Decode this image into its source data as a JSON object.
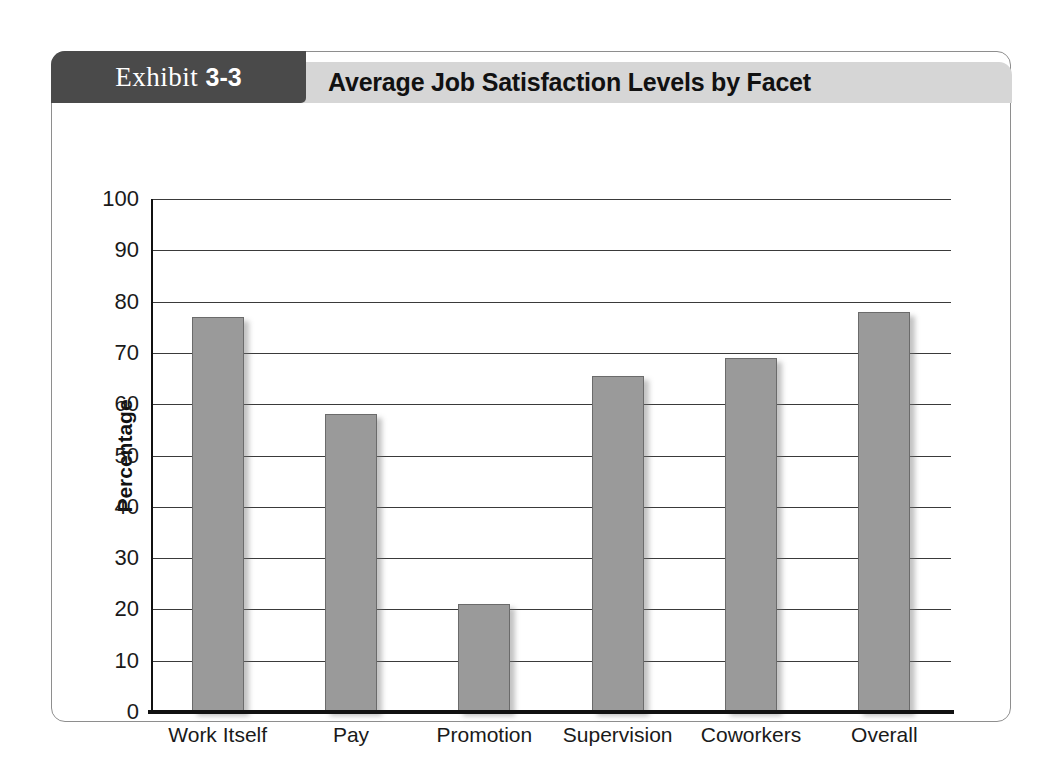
{
  "exhibit": {
    "tab_word": "Exhibit",
    "tab_number": "3-3",
    "title": "Average Job Satisfaction Levels by Facet"
  },
  "chart_data": {
    "type": "bar",
    "title": "Average Job Satisfaction Levels by Facet",
    "xlabel": "",
    "ylabel": "Percentage",
    "ylim": [
      0,
      100
    ],
    "ytick_step": 10,
    "yticks": [
      "100",
      "90",
      "80",
      "70",
      "60",
      "50",
      "40",
      "30",
      "20",
      "10",
      "0"
    ],
    "grid": true,
    "legend": "none",
    "bar_color": "#9a9a9a",
    "bar_edge_color": "#6b6b6b",
    "categories": [
      "Work Itself",
      "Pay",
      "Promotion",
      "Supervision",
      "Coworkers",
      "Overall"
    ],
    "values": [
      77,
      58,
      21,
      65.5,
      69,
      78
    ]
  },
  "colors": {
    "tab_background": "#4a4a4a",
    "title_band": "#d6d6d6",
    "card_border": "#8e8e8e",
    "axis": "#111111",
    "page_background": "#ffffff"
  }
}
